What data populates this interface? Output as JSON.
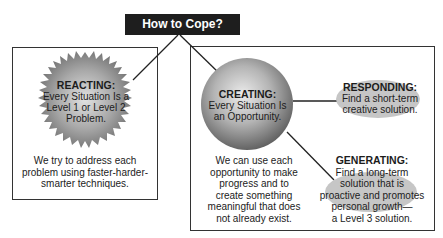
{
  "header": {
    "title": "How to Cope?"
  },
  "reacting": {
    "title": "REACTING:",
    "lines": [
      "Every Situation Is a",
      "Level 1 or Level 2",
      "Problem."
    ],
    "description": [
      "We try to address each",
      "problem using faster-harder-",
      "smarter techniques."
    ]
  },
  "creating": {
    "title": "CREATING:",
    "lines": [
      "Every Situation Is",
      "an Opportunity."
    ],
    "description": [
      "We can use each",
      "opportunity to make",
      "progress and to",
      "create something",
      "meaningful that does",
      "not already exist."
    ]
  },
  "responding": {
    "title": "RESPONDING:",
    "lines": [
      "Find a short-term",
      "creative solution."
    ]
  },
  "generating": {
    "title": "GENERATING:",
    "lines": [
      "Find a long-term",
      "solution that is",
      "proactive and promotes",
      "personal growth—",
      "a Level 3 solution."
    ]
  },
  "colors": {
    "header_bg": "#1e1e1e",
    "header_text": "#ffffff",
    "border": "#333333",
    "starburst_light": "#d8d8d8",
    "starburst_dark": "#6e6e6e",
    "sphere_light": "#e6e6e6",
    "sphere_dark": "#6a6a6a",
    "ellipse_fill": "#c8c8c8"
  }
}
